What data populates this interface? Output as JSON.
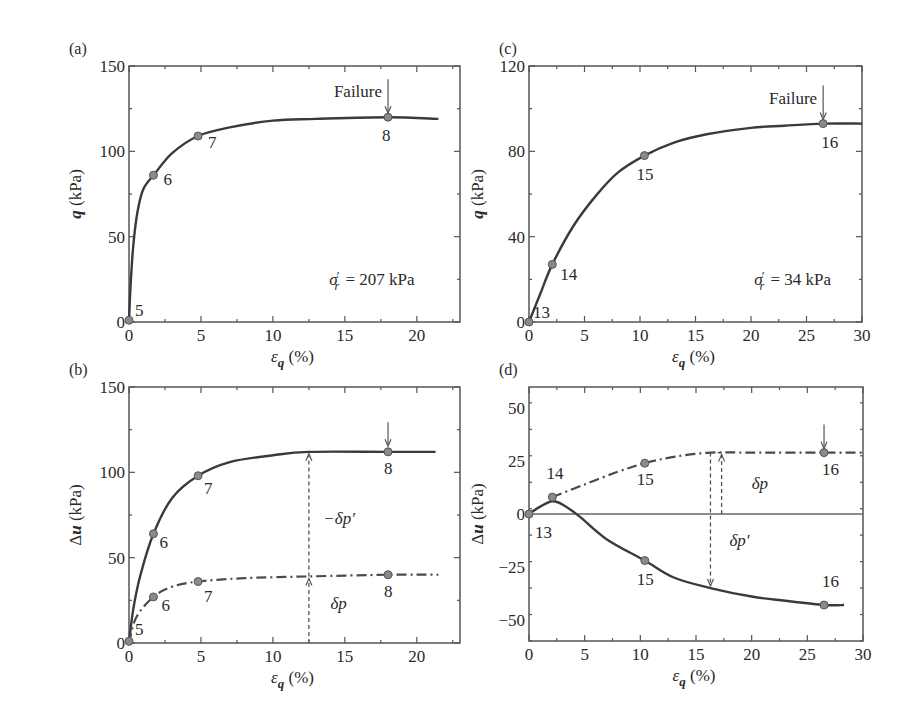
{
  "figure": {
    "panels": [
      "(a)",
      "(b)",
      "(c)",
      "(d)"
    ]
  },
  "chart_data": [
    {
      "id": "a",
      "panel_label": "(a)",
      "type": "line",
      "xlabel": "ε_q (%)",
      "ylabel": "q (kPa)",
      "xlim": [
        0,
        23
      ],
      "ylim": [
        0,
        150
      ],
      "xticks": [
        0,
        5,
        10,
        15,
        20
      ],
      "yticks": [
        0,
        50,
        100,
        150
      ],
      "grid": false,
      "annotations": [
        {
          "text": "Failure",
          "x": 18,
          "y": 120,
          "type": "arrow"
        },
        {
          "text": "σ′r = 207 kPa",
          "x": 16,
          "y": 25
        }
      ],
      "series": [
        {
          "name": "q",
          "style": "solid",
          "x": [
            0,
            0.1,
            0.3,
            0.6,
            1.0,
            1.8,
            3.0,
            4.8,
            7,
            10,
            13,
            18,
            21.5
          ],
          "y": [
            0,
            20,
            45,
            65,
            78,
            87,
            99,
            109,
            114,
            118,
            119,
            120,
            119
          ],
          "points": [
            {
              "label": "5",
              "x": 0,
              "y": 1
            },
            {
              "label": "6",
              "x": 1.7,
              "y": 86
            },
            {
              "label": "7",
              "x": 4.8,
              "y": 109
            },
            {
              "label": "8",
              "x": 18,
              "y": 120
            }
          ]
        }
      ]
    },
    {
      "id": "b",
      "panel_label": "(b)",
      "type": "line",
      "xlabel": "ε_q (%)",
      "ylabel": "Δu (kPa)",
      "xlim": [
        0,
        23
      ],
      "ylim": [
        0,
        150
      ],
      "xticks": [
        0,
        5,
        10,
        15,
        20
      ],
      "yticks": [
        0,
        50,
        100,
        150
      ],
      "grid": false,
      "annotations": [
        {
          "text": "−δp′",
          "x": 13.5,
          "y": 70
        },
        {
          "text": "δp",
          "x": 14,
          "y": 20
        },
        {
          "type": "arrow",
          "x": 18,
          "y": 113
        }
      ],
      "series": [
        {
          "name": "Δu (total)",
          "style": "solid",
          "x": [
            0,
            0.3,
            0.8,
            1.7,
            3.0,
            4.8,
            7,
            10,
            12.5,
            18,
            21.3
          ],
          "y": [
            0,
            20,
            40,
            64,
            85,
            98,
            106,
            110,
            112,
            112,
            112
          ],
          "points": [
            {
              "label": "5",
              "x": 0,
              "y": 1
            },
            {
              "label": "6",
              "x": 1.7,
              "y": 64
            },
            {
              "label": "7",
              "x": 4.8,
              "y": 98
            },
            {
              "label": "8",
              "x": 18,
              "y": 112
            }
          ]
        },
        {
          "name": "δp",
          "style": "dashdot",
          "x": [
            0,
            0.5,
            1.7,
            3.0,
            4.8,
            8,
            12.5,
            18,
            21.5
          ],
          "y": [
            0,
            15,
            27,
            33,
            36,
            38,
            39,
            40,
            40
          ],
          "points": [
            {
              "label": "6",
              "x": 1.7,
              "y": 27
            },
            {
              "label": "7",
              "x": 4.8,
              "y": 36
            },
            {
              "label": "8",
              "x": 18,
              "y": 40
            }
          ]
        }
      ]
    },
    {
      "id": "c",
      "panel_label": "(c)",
      "type": "line",
      "xlabel": "ε_q (%)",
      "ylabel": "q (kPa)",
      "xlim": [
        0,
        30
      ],
      "ylim": [
        0,
        120
      ],
      "xticks": [
        0,
        5,
        10,
        15,
        20,
        25,
        30
      ],
      "yticks": [
        0,
        40,
        80,
        120
      ],
      "grid": false,
      "annotations": [
        {
          "text": "Failure",
          "x": 26.5,
          "y": 93,
          "type": "arrow"
        },
        {
          "text": "σ′r = 34 kPa",
          "x": 23,
          "y": 20
        }
      ],
      "series": [
        {
          "name": "q",
          "style": "solid",
          "x": [
            0,
            1,
            2.1,
            4,
            6,
            8,
            10.4,
            13,
            16,
            20,
            23,
            26.5,
            30
          ],
          "y": [
            0,
            13,
            27,
            45,
            59,
            70,
            78,
            84,
            88,
            91,
            92,
            93,
            93
          ],
          "points": [
            {
              "label": "13",
              "x": 0,
              "y": 0
            },
            {
              "label": "14",
              "x": 2.1,
              "y": 27
            },
            {
              "label": "15",
              "x": 10.4,
              "y": 78
            },
            {
              "label": "16",
              "x": 26.5,
              "y": 93
            }
          ]
        }
      ]
    },
    {
      "id": "d",
      "panel_label": "(d)",
      "type": "line",
      "xlabel": "ε_q (%)",
      "ylabel": "Δu (kPa)",
      "xlim": [
        0,
        30
      ],
      "ylim": [
        -60,
        60
      ],
      "xticks": [
        0,
        5,
        10,
        15,
        20,
        25,
        30
      ],
      "yticks": [
        -50,
        -25,
        0,
        25,
        50
      ],
      "grid": false,
      "annotations": [
        {
          "text": "δp",
          "x": 20,
          "y": 12
        },
        {
          "text": "δp′",
          "x": 18,
          "y": -15
        },
        {
          "type": "arrow",
          "x": 26.5,
          "y": 29
        }
      ],
      "series": [
        {
          "name": "Δu (total)",
          "style": "solid",
          "x": [
            0,
            1,
            2.1,
            3,
            4.5,
            7,
            10.4,
            13,
            16.3,
            20,
            23,
            26.5,
            28.3
          ],
          "y": [
            0,
            3.5,
            6,
            4.5,
            -1,
            -12,
            -22,
            -30,
            -35,
            -39,
            -41,
            -43,
            -43
          ],
          "points": [
            {
              "label": "13",
              "x": 0,
              "y": 0
            },
            {
              "label": "15",
              "x": 10.4,
              "y": -22
            },
            {
              "label": "16",
              "x": 26.5,
              "y": -43
            }
          ]
        },
        {
          "name": "δp",
          "style": "dashdot",
          "x": [
            2.1,
            5,
            8,
            10.4,
            13,
            16.3,
            20,
            26.5,
            30
          ],
          "y": [
            8,
            14,
            20,
            24,
            27,
            29,
            29,
            29,
            29
          ],
          "points": [
            {
              "label": "14",
              "x": 2.1,
              "y": 8
            },
            {
              "label": "15",
              "x": 10.4,
              "y": 24
            },
            {
              "label": "16",
              "x": 26.5,
              "y": 29
            }
          ]
        }
      ]
    }
  ]
}
